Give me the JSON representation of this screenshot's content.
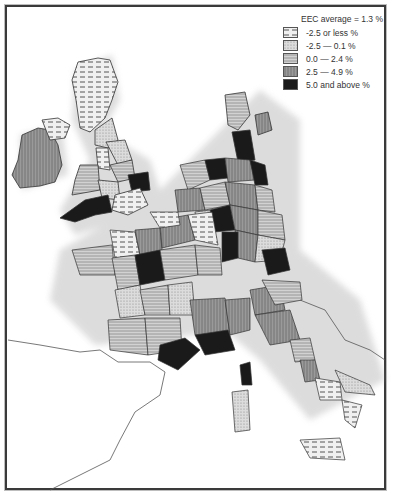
{
  "map": {
    "title": "EEC regional growth",
    "legend": {
      "title": "EEC average = 1.3 %",
      "classes": [
        {
          "label": "-2.5 or less %",
          "pattern": "dashes",
          "color": "#e6e6e6"
        },
        {
          "label": "-2.5 —  0.1  %",
          "pattern": "dots",
          "color": "#cfcfcf"
        },
        {
          "label": "0.0 —  2.4  %",
          "pattern": "hlines",
          "color": "#c4c4c4"
        },
        {
          "label": "2.5 —  4.9  %",
          "pattern": "vlines",
          "color": "#8d8d8d"
        },
        {
          "label": "5.0 and above %",
          "pattern": "solid",
          "color": "#1a1a1a"
        }
      ]
    },
    "regions_visible": [
      "Ireland",
      "United Kingdom",
      "Denmark",
      "Netherlands",
      "Belgium",
      "Germany",
      "France",
      "Italy",
      "Corsica",
      "Sardinia",
      "Sicily"
    ]
  }
}
